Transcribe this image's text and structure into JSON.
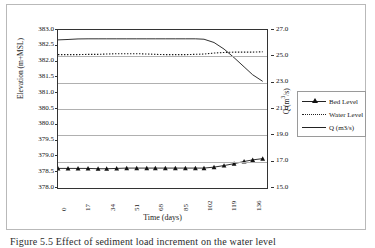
{
  "figure": {
    "caption": "Figure 5.5  Effect of sediment load increment on the water level"
  },
  "chart_data": {
    "type": "line",
    "title": "",
    "xlabel": "Time (days)",
    "ylabel": "Elevation (m+MSL)",
    "y2label": "Q (m3/s)",
    "xlim": [
      0,
      146
    ],
    "ylim": [
      378.0,
      383.0
    ],
    "y2lim": [
      15.0,
      27.0
    ],
    "grid": true,
    "legend_position": "right-outside",
    "xticks": [
      "0",
      "17",
      "34",
      "51",
      "68",
      "85",
      "102",
      "119",
      "136"
    ],
    "xtick_values": [
      0,
      17,
      34,
      51,
      68,
      85,
      102,
      119,
      136
    ],
    "yticks": [
      "378.0",
      "378.5",
      "379.0",
      "379.5",
      "380.0",
      "380.5",
      "381.0",
      "381.5",
      "382.0",
      "382.5",
      "383.0"
    ],
    "ytick_values": [
      378.0,
      378.5,
      379.0,
      379.5,
      380.0,
      380.5,
      381.0,
      381.5,
      382.0,
      382.5,
      383.0
    ],
    "y2ticks": [
      "15.0",
      "17.0",
      "19.0",
      "21.0",
      "23.0",
      "25.0",
      "27.0"
    ],
    "y2tick_values": [
      15.0,
      17.0,
      19.0,
      21.0,
      23.0,
      25.0,
      27.0
    ],
    "x": [
      0,
      7,
      14,
      21,
      28,
      34,
      41,
      48,
      55,
      62,
      68,
      75,
      82,
      89,
      96,
      102,
      109,
      116,
      123,
      130,
      136,
      143
    ],
    "series": [
      {
        "name": "Bed Level",
        "axis": "left",
        "style": "line-marker",
        "marker": "triangle",
        "values": [
          378.62,
          378.62,
          378.62,
          378.62,
          378.61,
          378.61,
          378.62,
          378.63,
          378.63,
          378.63,
          378.63,
          378.63,
          378.63,
          378.63,
          378.63,
          378.63,
          378.66,
          378.71,
          378.77,
          378.84,
          378.89,
          378.93
        ]
      },
      {
        "name": "Water Level",
        "axis": "left",
        "style": "dotted",
        "values": [
          382.22,
          382.22,
          382.22,
          382.23,
          382.23,
          382.24,
          382.25,
          382.25,
          382.25,
          382.24,
          382.23,
          382.22,
          382.22,
          382.22,
          382.23,
          382.24,
          382.27,
          382.29,
          382.3,
          382.3,
          382.3,
          382.31
        ]
      },
      {
        "name": "Q (m3/s)",
        "axis": "right",
        "style": "solid",
        "values": [
          26.25,
          26.28,
          26.32,
          26.33,
          26.33,
          26.33,
          26.33,
          26.33,
          26.33,
          26.33,
          26.33,
          26.33,
          26.33,
          26.33,
          26.33,
          26.3,
          26.05,
          25.55,
          24.9,
          24.2,
          23.6,
          23.1
        ]
      }
    ]
  },
  "legend": {
    "items": [
      {
        "label": "Bed Level",
        "key": "line-with-triangle-marker"
      },
      {
        "label": "Water Level",
        "key": "dotted-line"
      },
      {
        "label": "Q (m3/s)",
        "key": "solid-line"
      }
    ]
  }
}
